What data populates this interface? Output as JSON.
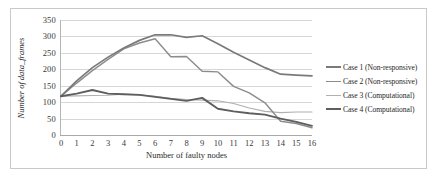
{
  "chart_data": {
    "type": "line",
    "title": "",
    "xlabel": "Number of faulty nodes",
    "ylabel": "Number of data_frames",
    "xlim": [
      0,
      16
    ],
    "ylim": [
      0,
      350
    ],
    "xticks": [
      0,
      1,
      2,
      3,
      4,
      5,
      6,
      7,
      8,
      9,
      10,
      11,
      12,
      13,
      14,
      15,
      16
    ],
    "yticks": [
      0,
      50,
      100,
      150,
      200,
      250,
      300,
      350
    ],
    "grid": "horizontal",
    "legend_position": "right",
    "x": [
      0,
      1,
      2,
      3,
      4,
      5,
      6,
      7,
      8,
      9,
      10,
      11,
      12,
      13,
      14,
      15,
      16
    ],
    "series": [
      {
        "name": "Case 1 (Non-responsive)",
        "color": "#7a7a7a",
        "width": 1.7,
        "values": [
          118,
          165,
          205,
          237,
          265,
          288,
          305,
          305,
          297,
          302,
          278,
          252,
          228,
          205,
          185,
          182,
          180
        ]
      },
      {
        "name": "Case 2 (Non-responsive)",
        "color": "#8c8c8c",
        "width": 1.4,
        "values": [
          118,
          158,
          196,
          230,
          262,
          280,
          293,
          238,
          239,
          194,
          192,
          148,
          128,
          98,
          42,
          35,
          22
        ]
      },
      {
        "name": "Case 3 (Computational)",
        "color": "#b0b0b0",
        "width": 1.1,
        "values": [
          118,
          119,
          120,
          121,
          124,
          122,
          118,
          112,
          108,
          106,
          104,
          96,
          82,
          72,
          68,
          70,
          70
        ]
      },
      {
        "name": "Case 4 (Computational)",
        "color": "#5e5e5e",
        "width": 1.9,
        "values": [
          118,
          126,
          137,
          126,
          124,
          122,
          116,
          110,
          104,
          113,
          80,
          72,
          66,
          62,
          50,
          40,
          28
        ]
      }
    ]
  },
  "legend": {
    "items": [
      {
        "label": "Case 1 (Non-responsive)"
      },
      {
        "label": "Case 2 (Non-responsive)"
      },
      {
        "label": "Case 3 (Computational)"
      },
      {
        "label": "Case 4 (Computational)"
      }
    ]
  }
}
